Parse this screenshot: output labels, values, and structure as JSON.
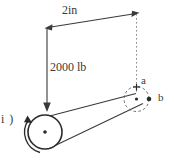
{
  "figure": {
    "item_label": "i )",
    "dimension_label": "2in",
    "load_label": "2000 lb",
    "point_a_label": "a",
    "point_b_label": "b",
    "colors": {
      "background": "#ffffff",
      "line": "#3a3a3a",
      "dashed_line": "#8a8a8a",
      "text": "#3a3a3a"
    },
    "elements": {
      "left_end_circle": "solid-circle-with-center-dot",
      "right_end_circle": "dashed-circle-with-center-dot",
      "torque_arrow": "curved-ccw-arrow-left-end",
      "load_arrow": "vertical-down-arrow",
      "dimension_arrow": "double-headed-horizontal-arrow",
      "extension_line": "dotted-vertical-line-right"
    }
  }
}
